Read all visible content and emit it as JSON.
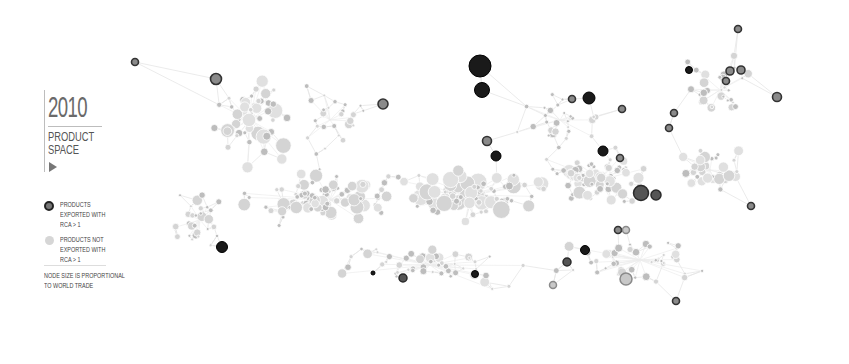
{
  "legend": {
    "year": "2010",
    "title_line1": "PRODUCT",
    "title_line2": "SPACE",
    "play_icon": "play-triangle-icon",
    "exported_label": [
      "PRODUCTS",
      "EXPORTED WITH",
      "RCA > 1"
    ],
    "not_exported_label": [
      "PRODUCTS NOT",
      "EXPORTED WITH",
      "RCA > 1"
    ],
    "size_note": [
      "NODE SIZE IS PROPORTIONAL",
      "TO WORLD TRADE"
    ]
  },
  "colors": {
    "background": "#ffffff",
    "edge": "#e6e6e6",
    "node_light": "#d4d4d4",
    "node_light_alt": "#e0e0e0",
    "node_mid": "#bdbdbd",
    "exported_fill_dark": "#1a1a1a",
    "exported_fill_mid": "#555555",
    "exported_ring": "#333333"
  },
  "graph": {
    "type": "network",
    "description": "Product space network; highlighted dark nodes are products exported with RCA > 1",
    "exported_nodes": [
      {
        "x": 135,
        "y": 62,
        "r": 3.5,
        "tone": "ring"
      },
      {
        "x": 216,
        "y": 79,
        "r": 5.5,
        "tone": "ring"
      },
      {
        "x": 383,
        "y": 104,
        "r": 5,
        "tone": "ring"
      },
      {
        "x": 480,
        "y": 66,
        "r": 11,
        "tone": "dark"
      },
      {
        "x": 482,
        "y": 90,
        "r": 7.5,
        "tone": "dark"
      },
      {
        "x": 487,
        "y": 141,
        "r": 4.5,
        "tone": "ring"
      },
      {
        "x": 496,
        "y": 156,
        "r": 5,
        "tone": "dark"
      },
      {
        "x": 572,
        "y": 99,
        "r": 3.5,
        "tone": "ring"
      },
      {
        "x": 589,
        "y": 98,
        "r": 6,
        "tone": "dark"
      },
      {
        "x": 622,
        "y": 109,
        "r": 3.5,
        "tone": "ring"
      },
      {
        "x": 669,
        "y": 128,
        "r": 3.5,
        "tone": "ring"
      },
      {
        "x": 603,
        "y": 151,
        "r": 5,
        "tone": "dark"
      },
      {
        "x": 620,
        "y": 158,
        "r": 3.5,
        "tone": "ring"
      },
      {
        "x": 674,
        "y": 113,
        "r": 3.5,
        "tone": "ring"
      },
      {
        "x": 689,
        "y": 70,
        "r": 3.5,
        "tone": "dark"
      },
      {
        "x": 738,
        "y": 29,
        "r": 3.5,
        "tone": "ring"
      },
      {
        "x": 730,
        "y": 71,
        "r": 4,
        "tone": "ring"
      },
      {
        "x": 741,
        "y": 70,
        "r": 4,
        "tone": "ring"
      },
      {
        "x": 726,
        "y": 81,
        "r": 3.5,
        "tone": "ring"
      },
      {
        "x": 777,
        "y": 97,
        "r": 4.5,
        "tone": "ring"
      },
      {
        "x": 641,
        "y": 193,
        "r": 7.5,
        "tone": "mid"
      },
      {
        "x": 656,
        "y": 195,
        "r": 5,
        "tone": "mid"
      },
      {
        "x": 751,
        "y": 206,
        "r": 3.5,
        "tone": "ring"
      },
      {
        "x": 618,
        "y": 230,
        "r": 3.5,
        "tone": "ring"
      },
      {
        "x": 626,
        "y": 230,
        "r": 3.5,
        "tone": "ringlight"
      },
      {
        "x": 585,
        "y": 250,
        "r": 4.5,
        "tone": "dark"
      },
      {
        "x": 567,
        "y": 262,
        "r": 4,
        "tone": "mid"
      },
      {
        "x": 553,
        "y": 285,
        "r": 3.5,
        "tone": "ringlight"
      },
      {
        "x": 626,
        "y": 279,
        "r": 6,
        "tone": "ringlight"
      },
      {
        "x": 676,
        "y": 301,
        "r": 3.5,
        "tone": "ring"
      },
      {
        "x": 222,
        "y": 247,
        "r": 5.5,
        "tone": "dark"
      },
      {
        "x": 403,
        "y": 278,
        "r": 4,
        "tone": "mid"
      },
      {
        "x": 475,
        "y": 274,
        "r": 3.5,
        "tone": "dark"
      },
      {
        "x": 373,
        "y": 273,
        "r": 2,
        "tone": "dark"
      }
    ],
    "clusters": [
      {
        "cx": 250,
        "cy": 120,
        "rx": 50,
        "ry": 55,
        "count": 55,
        "rmin": 2,
        "rmax": 8
      },
      {
        "cx": 330,
        "cy": 200,
        "rx": 110,
        "ry": 30,
        "count": 90,
        "rmin": 2,
        "rmax": 7
      },
      {
        "cx": 470,
        "cy": 195,
        "rx": 90,
        "ry": 30,
        "count": 90,
        "rmin": 2,
        "rmax": 9
      },
      {
        "cx": 600,
        "cy": 180,
        "rx": 80,
        "ry": 35,
        "count": 75,
        "rmin": 2,
        "rmax": 7
      },
      {
        "cx": 710,
        "cy": 170,
        "rx": 40,
        "ry": 30,
        "count": 35,
        "rmin": 2,
        "rmax": 6
      },
      {
        "cx": 330,
        "cy": 120,
        "rx": 60,
        "ry": 60,
        "count": 30,
        "rmin": 1.5,
        "rmax": 5
      },
      {
        "cx": 560,
        "cy": 120,
        "rx": 60,
        "ry": 40,
        "count": 30,
        "rmin": 1.5,
        "rmax": 4
      },
      {
        "cx": 720,
        "cy": 90,
        "rx": 55,
        "ry": 45,
        "count": 30,
        "rmin": 1.5,
        "rmax": 5
      },
      {
        "cx": 200,
        "cy": 220,
        "rx": 50,
        "ry": 40,
        "count": 30,
        "rmin": 1.5,
        "rmax": 6
      },
      {
        "cx": 430,
        "cy": 265,
        "rx": 110,
        "ry": 28,
        "count": 55,
        "rmin": 1.5,
        "rmax": 5
      },
      {
        "cx": 640,
        "cy": 260,
        "rx": 90,
        "ry": 35,
        "count": 45,
        "rmin": 1.5,
        "rmax": 5
      }
    ],
    "seed": 2010
  }
}
